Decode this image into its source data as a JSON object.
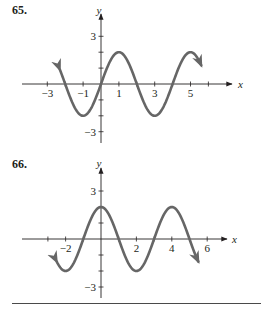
{
  "chart_data": [
    {
      "type": "line",
      "label": "65.",
      "title": "",
      "xlabel": "x",
      "ylabel": "y",
      "function": "y = 2 sin(pi x / 2)",
      "amplitude": 2,
      "period": 4,
      "x_range": [
        -2.3,
        5.6
      ],
      "xlim": [
        -3.5,
        6.5
      ],
      "ylim": [
        -3.5,
        3.8
      ],
      "x_ticks": [
        -3,
        -2,
        -1,
        0,
        1,
        2,
        3,
        4,
        5,
        6
      ],
      "x_tick_labels": [
        "−3",
        "−1",
        "1",
        "3",
        "5"
      ],
      "x_tick_label_values": [
        -3,
        -1,
        1,
        3,
        5
      ],
      "y_ticks": [
        -3,
        -2,
        -1,
        1,
        2,
        3
      ],
      "y_tick_labels": [
        "3",
        "−3"
      ],
      "y_tick_label_values": [
        3,
        -3
      ],
      "key_points": {
        "x": [
          -2,
          -1,
          0,
          1,
          2,
          3,
          4,
          5
        ],
        "y": [
          0,
          -2,
          0,
          2,
          0,
          -2,
          0,
          2
        ]
      },
      "arrows": "both ends",
      "grid": false,
      "color": "#666666"
    },
    {
      "type": "line",
      "label": "66.",
      "title": "",
      "xlabel": "x",
      "ylabel": "y",
      "function": "y = 2 cos(pi x / 2)",
      "amplitude": 2,
      "period": 4,
      "x_range": [
        -2.5,
        5.5
      ],
      "xlim": [
        -3.5,
        7
      ],
      "ylim": [
        -3.5,
        3.8
      ],
      "x_ticks": [
        -3,
        -2,
        -1,
        0,
        1,
        2,
        3,
        4,
        5,
        6
      ],
      "x_tick_labels": [
        "−2",
        "2",
        "4",
        "6"
      ],
      "x_tick_label_values": [
        -2,
        2,
        4,
        6
      ],
      "y_ticks": [
        -3,
        -2,
        -1,
        1,
        2,
        3
      ],
      "y_tick_labels": [
        "3",
        "−3"
      ],
      "y_tick_label_values": [
        3,
        -3
      ],
      "key_points": {
        "x": [
          -2,
          -1,
          0,
          1,
          2,
          3,
          4,
          5
        ],
        "y": [
          -2,
          0,
          2,
          0,
          -2,
          0,
          2,
          0
        ]
      },
      "arrows": "both ends",
      "grid": false,
      "color": "#666666"
    }
  ],
  "labels": {
    "p65": "65.",
    "p66": "66."
  },
  "colors": {
    "curve": "#666666",
    "axis": "#231f20",
    "rule": "#4a4a4a"
  }
}
